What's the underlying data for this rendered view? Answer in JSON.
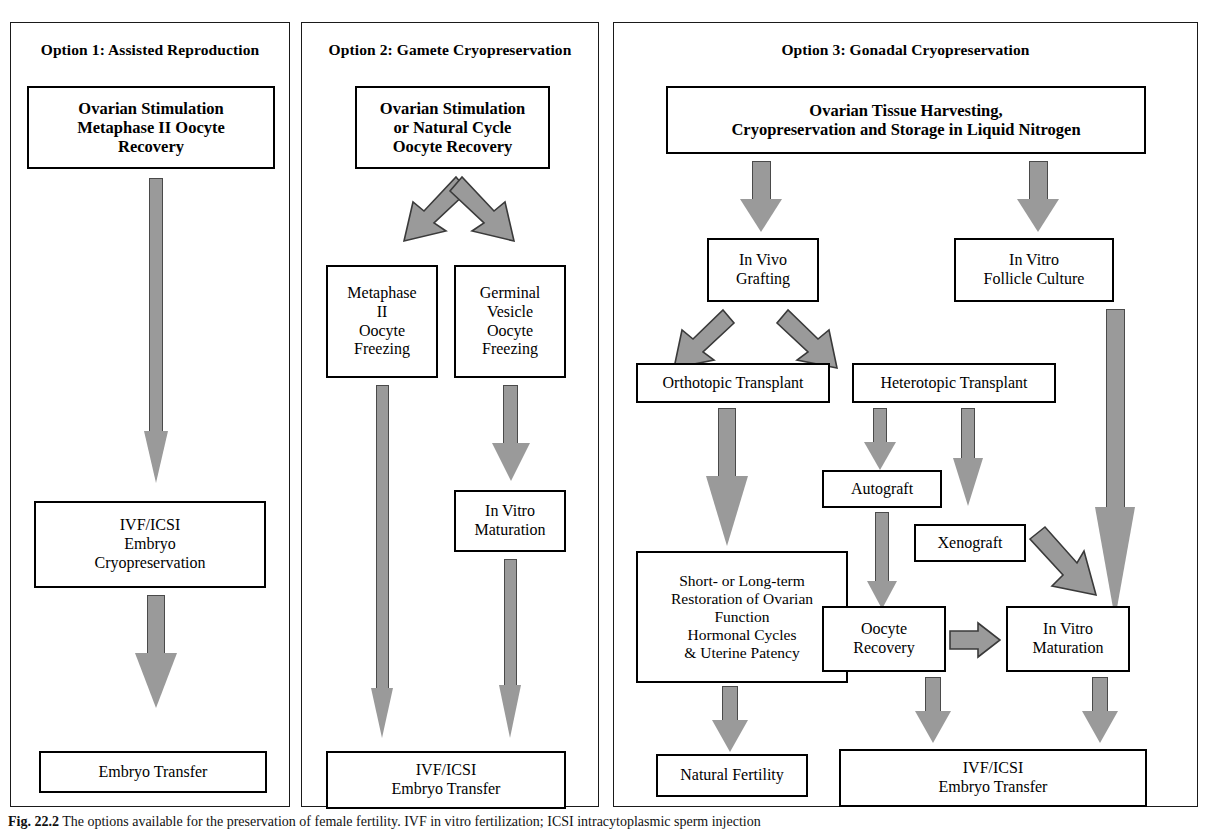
{
  "figure": {
    "caption_label": "Fig. 22.2",
    "caption_text": "The options available for the preservation of female fertility. IVF in vitro fertilization; ICSI intracytoplasmic sperm injection"
  },
  "panels": [
    {
      "id": "option1",
      "title": "Option 1: Assisted Reproduction",
      "boxes": [
        {
          "id": "o1-b1",
          "lines": [
            "Ovarian Stimulation",
            "Metaphase II Oocyte",
            "Recovery"
          ],
          "style": "bold"
        },
        {
          "id": "o1-b2",
          "lines": [
            "IVF/ICSI",
            "Embryo",
            "Cryopreservation"
          ],
          "style": "plain"
        },
        {
          "id": "o1-b3",
          "lines": [
            "Embryo Transfer"
          ],
          "style": "plain"
        }
      ]
    },
    {
      "id": "option2",
      "title": "Option 2: Gamete Cryopreservation",
      "boxes": [
        {
          "id": "o2-b1",
          "lines": [
            "Ovarian Stimulation",
            "or Natural  Cycle",
            "Oocyte Recovery"
          ],
          "style": "bold"
        },
        {
          "id": "o2-b2",
          "lines": [
            "Metaphase",
            "II",
            "Oocyte",
            "Freezing"
          ],
          "style": "plain"
        },
        {
          "id": "o2-b3",
          "lines": [
            "Germinal",
            "Vesicle",
            "Oocyte",
            "Freezing"
          ],
          "style": "plain"
        },
        {
          "id": "o2-b4",
          "lines": [
            "In Vitro",
            "Maturation"
          ],
          "style": "plain"
        },
        {
          "id": "o2-b5",
          "lines": [
            "IVF/ICSI",
            "Embryo Transfer"
          ],
          "style": "plain"
        }
      ]
    },
    {
      "id": "option3",
      "title": "Option 3: Gonadal Cryopreservation",
      "boxes": [
        {
          "id": "o3-b1",
          "lines": [
            "Ovarian Tissue  Harvesting,",
            "Cryopreservation and Storage in Liquid Nitrogen"
          ],
          "style": "bold"
        },
        {
          "id": "o3-b2",
          "lines": [
            "In Vivo",
            "Grafting"
          ],
          "style": "plain"
        },
        {
          "id": "o3-b3",
          "lines": [
            "In Vitro",
            "Follicle Culture"
          ],
          "style": "plain"
        },
        {
          "id": "o3-b4",
          "lines": [
            "Orthotopic Transplant"
          ],
          "style": "plain"
        },
        {
          "id": "o3-b5",
          "lines": [
            "Heterotopic Transplant"
          ],
          "style": "plain"
        },
        {
          "id": "o3-b6",
          "lines": [
            "Autograft"
          ],
          "style": "plain"
        },
        {
          "id": "o3-b7",
          "lines": [
            "Xenograft"
          ],
          "style": "plain"
        },
        {
          "id": "o3-b8",
          "lines": [
            "Short- or Long-term",
            "Restoration of  Ovarian",
            "Function",
            "Hormonal Cycles",
            "& Uterine Patency"
          ],
          "style": "plain"
        },
        {
          "id": "o3-b9",
          "lines": [
            "Oocyte",
            "Recovery"
          ],
          "style": "plain"
        },
        {
          "id": "o3-b10",
          "lines": [
            "In Vitro",
            "Maturation"
          ],
          "style": "plain"
        },
        {
          "id": "o3-b11",
          "lines": [
            "Natural Fertility"
          ],
          "style": "plain"
        },
        {
          "id": "o3-b12",
          "lines": [
            "IVF/ICSI",
            "Embryo Transfer"
          ],
          "style": "plain"
        }
      ]
    }
  ],
  "text": {
    "o1_b1_l1": "Ovarian Stimulation",
    "o1_b1_l2": "Metaphase II Oocyte",
    "o1_b1_l3": "Recovery",
    "o1_b2_l1": "IVF/ICSI",
    "o1_b2_l2": "Embryo",
    "o1_b2_l3": "Cryopreservation",
    "o1_b3_l1": "Embryo Transfer",
    "o2_b1_l1": "Ovarian Stimulation",
    "o2_b1_l2": "or Natural  Cycle",
    "o2_b1_l3": "Oocyte Recovery",
    "o2_b2_l1": "Metaphase",
    "o2_b2_l2": "II",
    "o2_b2_l3": "Oocyte",
    "o2_b2_l4": "Freezing",
    "o2_b3_l1": "Germinal",
    "o2_b3_l2": "Vesicle",
    "o2_b3_l3": "Oocyte",
    "o2_b3_l4": "Freezing",
    "o2_b4_l1": "In Vitro",
    "o2_b4_l2": "Maturation",
    "o2_b5_l1": "IVF/ICSI",
    "o2_b5_l2": "Embryo Transfer",
    "o3_b1_l1": "Ovarian Tissue  Harvesting,",
    "o3_b1_l2": "Cryopreservation and Storage in Liquid Nitrogen",
    "o3_b2_l1": "In Vivo",
    "o3_b2_l2": "Grafting",
    "o3_b3_l1": "In Vitro",
    "o3_b3_l2": "Follicle Culture",
    "o3_b4_l1": "Orthotopic Transplant",
    "o3_b5_l1": "Heterotopic Transplant",
    "o3_b6_l1": "Autograft",
    "o3_b7_l1": "Xenograft",
    "o3_b8_l1": "Short- or Long-term",
    "o3_b8_l2": "Restoration of  Ovarian",
    "o3_b8_l3": "Function",
    "o3_b8_l4": "Hormonal Cycles",
    "o3_b8_l5": "& Uterine Patency",
    "o3_b9_l1": "Oocyte",
    "o3_b9_l2": "Recovery",
    "o3_b10_l1": "In Vitro",
    "o3_b10_l2": "Maturation",
    "o3_b11_l1": "Natural Fertility",
    "o3_b12_l1": "IVF/ICSI",
    "o3_b12_l2": "Embryo Transfer",
    "panel1_title": "Option 1: Assisted Reproduction",
    "panel2_title": "Option 2: Gamete Cryopreservation",
    "panel3_title": "Option 3: Gonadal Cryopreservation",
    "caption_label": "Fig. 22.2",
    "caption_body": "The options available for the preservation of female fertility. IVF in vitro fertilization; ICSI intracytoplasmic sperm injection"
  },
  "colors": {
    "arrow_fill": "#9a9a9a",
    "arrow_stroke": "#4a4a4a",
    "box_border": "#000000",
    "panel_border": "#1a1a1a",
    "background": "#ffffff"
  }
}
